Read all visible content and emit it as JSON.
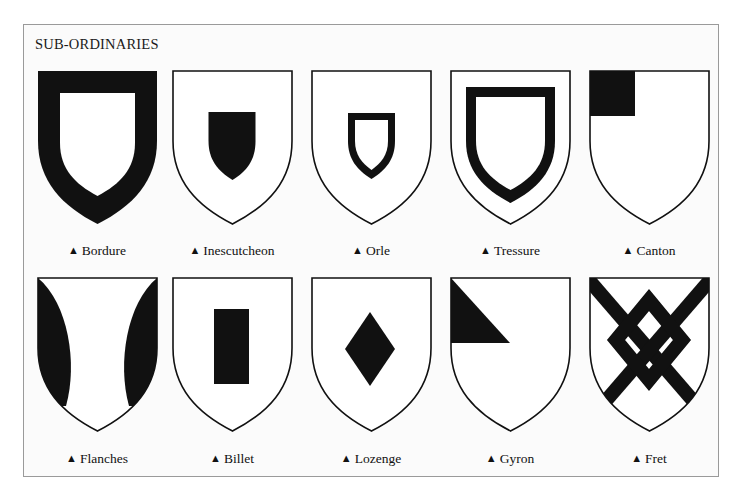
{
  "title": "SUB-ORDINARIES",
  "label_marker": "▲",
  "colors": {
    "tincture_dark": "#111111",
    "field": "#ffffff",
    "frame_border": "#9a9a9a"
  },
  "rows": [
    [
      {
        "name": "Bordure",
        "charge": "bordure"
      },
      {
        "name": "Inescutcheon",
        "charge": "inescutcheon"
      },
      {
        "name": "Orle",
        "charge": "orle"
      },
      {
        "name": "Tressure",
        "charge": "tressure"
      },
      {
        "name": "Canton",
        "charge": "canton"
      }
    ],
    [
      {
        "name": "Flanches",
        "charge": "flanches"
      },
      {
        "name": "Billet",
        "charge": "billet"
      },
      {
        "name": "Lozenge",
        "charge": "lozenge"
      },
      {
        "name": "Gyron",
        "charge": "gyron"
      },
      {
        "name": "Fret",
        "charge": "fret"
      }
    ]
  ]
}
